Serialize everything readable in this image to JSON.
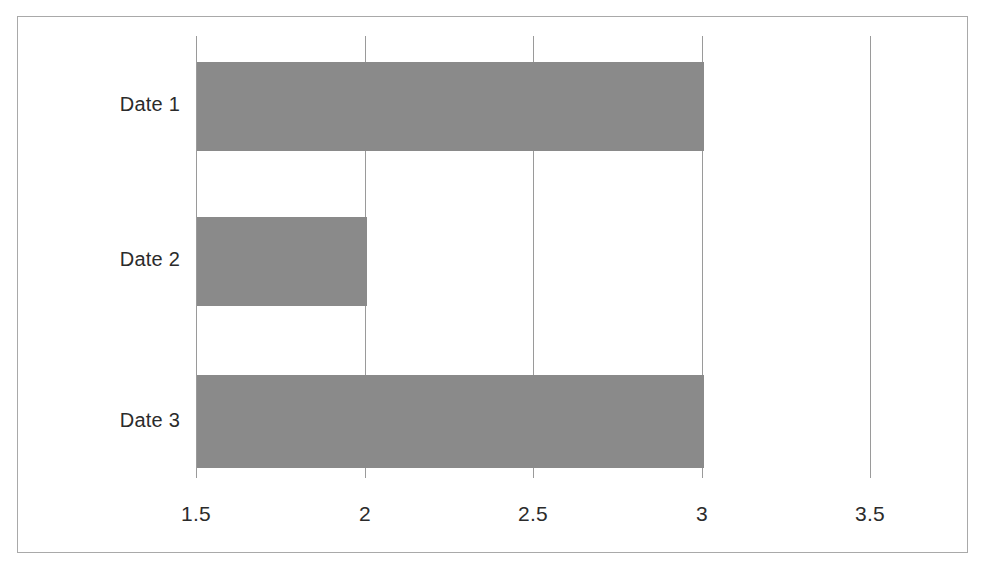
{
  "chart_data": {
    "type": "bar",
    "orientation": "horizontal",
    "title": "",
    "subtitle": "",
    "xlabel": "",
    "ylabel": "",
    "categories": [
      "Date 1",
      "Date 2",
      "Date 3"
    ],
    "values": [
      3,
      2,
      3
    ],
    "series": [
      {
        "name": "",
        "values": [
          3,
          2,
          3
        ]
      }
    ],
    "xlim": [
      1.5,
      3.5
    ],
    "xticks": [
      1.5,
      2,
      2.5,
      3,
      3.5
    ],
    "xtick_labels": [
      "1.5",
      "2",
      "2.5",
      "3",
      "3.5"
    ],
    "ytick_labels": [
      "Date 1",
      "Date 2",
      "Date 3"
    ],
    "grid": true,
    "grid_axis": "x",
    "legend": false,
    "legend_position": "none",
    "bar_color": "#8a8a8a",
    "gridline_color": "#9a9a9a",
    "frame_color": "#a9a9a9",
    "background_color": "#ffffff",
    "text_color": "#2b2b2b",
    "annotations": []
  },
  "axis": {
    "ticks": [
      {
        "label": "1.5",
        "value": 1.5
      },
      {
        "label": "2",
        "value": 2
      },
      {
        "label": "2.5",
        "value": 2.5
      },
      {
        "label": "3",
        "value": 3
      },
      {
        "label": "3.5",
        "value": 3.5
      }
    ]
  },
  "bars": [
    {
      "category": "Date 1",
      "value": 3
    },
    {
      "category": "Date 2",
      "value": 2
    },
    {
      "category": "Date 3",
      "value": 3
    }
  ]
}
